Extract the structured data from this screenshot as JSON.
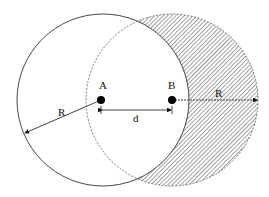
{
  "diagram": {
    "circle_a": {
      "center_label": "A",
      "cx": 103,
      "cy": 100,
      "r": 86
    },
    "circle_b": {
      "center_label": "B",
      "cx": 172,
      "cy": 100,
      "r": 86
    },
    "radius_label_a": "R",
    "radius_label_b": "R",
    "distance_label": "d",
    "shaded_region": "Circle B minus overlap with circle A (hatched)"
  }
}
